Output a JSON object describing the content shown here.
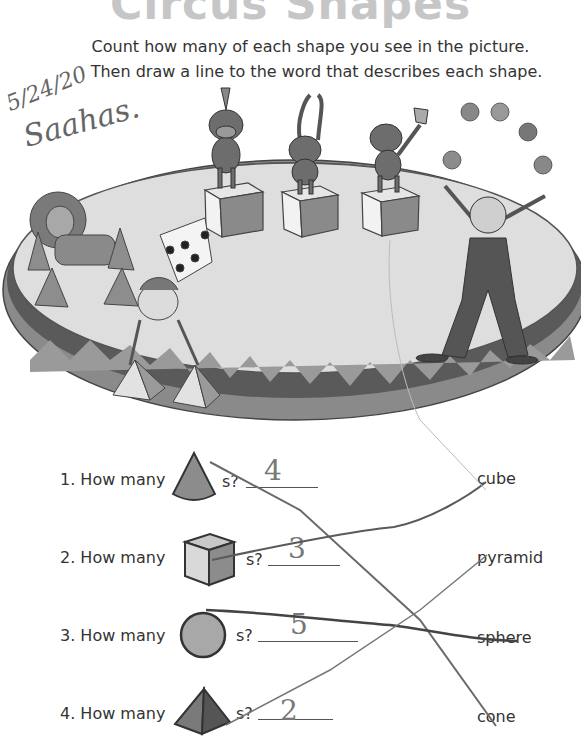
{
  "worksheet": {
    "title": "Circus Shapes",
    "instructions": [
      "Count how many of each shape you see in the picture.",
      "Then draw a line to the word that describes each shape."
    ],
    "handwritten": {
      "date": "5/24/20",
      "name": "Saahas."
    }
  },
  "questions": [
    {
      "number": "1.",
      "prefix": "1. How many",
      "shape_icon": "cone-icon",
      "suffix": "s?",
      "answer": "4"
    },
    {
      "number": "2.",
      "prefix": "2. How many",
      "shape_icon": "cube-icon",
      "suffix": "s?",
      "answer": "3"
    },
    {
      "number": "3.",
      "prefix": "3. How many",
      "shape_icon": "sphere-icon",
      "suffix": "s?",
      "answer": "5"
    },
    {
      "number": "4.",
      "prefix": "4. How many",
      "shape_icon": "pyramid-icon",
      "suffix": "s?",
      "answer": "2"
    }
  ],
  "words": [
    "cube",
    "pyramid",
    "sphere",
    "cone"
  ],
  "matches": [
    {
      "from": "cone",
      "to": "cone"
    },
    {
      "from": "cube",
      "to": "cube"
    },
    {
      "from": "sphere",
      "to": "sphere"
    },
    {
      "from": "pyramid",
      "to": "pyramid"
    }
  ],
  "colors": {
    "title": "#c6c6c6",
    "ring_dark": "#5a5a5a",
    "ring_light": "#9a9a9a",
    "floor": "#dcdcdc",
    "pencil": "#6a6a6a"
  }
}
